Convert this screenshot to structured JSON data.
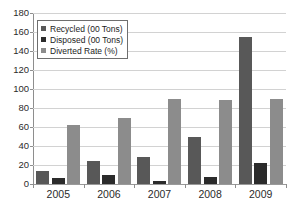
{
  "chart_data": {
    "type": "bar",
    "title": "",
    "subtitle": "",
    "xlabel": "",
    "ylabel": "",
    "categories": [
      "2005",
      "2006",
      "2007",
      "2008",
      "2009"
    ],
    "series": [
      {
        "name": "Recycled (00 Tons)",
        "values": [
          14,
          24,
          28,
          50,
          155
        ],
        "color": "#585858"
      },
      {
        "name": "Disposed (00 Tons)",
        "values": [
          6,
          9,
          3,
          7,
          22
        ],
        "color": "#2b2b2b"
      },
      {
        "name": "Diverted Rate (%)",
        "values": [
          62,
          69,
          90,
          88,
          90
        ],
        "color": "#8c8c8c"
      }
    ],
    "ylim": [
      0,
      180
    ],
    "yticks": [
      0,
      20,
      40,
      60,
      80,
      100,
      120,
      140,
      160,
      180
    ],
    "ytick_labels": [
      "0",
      "20",
      "40",
      "60",
      "80",
      "100",
      "120",
      "140",
      "160",
      "180"
    ],
    "grid": true,
    "grid_axis": "y",
    "legend_position": "upper-left",
    "annotations": []
  },
  "legend": {
    "items": [
      {
        "label": "Recycled (00 Tons)",
        "color": "#585858",
        "swatch_name": "legend-swatch-recycled"
      },
      {
        "label": "Disposed (00 Tons)",
        "color": "#2b2b2b",
        "swatch_name": "legend-swatch-disposed"
      },
      {
        "label": "Diverted Rate (%)",
        "color": "#8c8c8c",
        "swatch_name": "legend-swatch-diverted"
      }
    ]
  },
  "colors": {
    "background": "#ffffff",
    "gridline": "#d2d2d2",
    "axis": "#8e8e8e",
    "text": "#2b2b2b"
  }
}
